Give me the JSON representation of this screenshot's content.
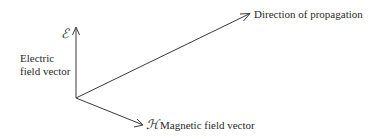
{
  "diagram": {
    "type": "electromagnetic-wave-vectors",
    "origin": [
      76,
      98
    ],
    "vectors": {
      "electric": {
        "symbol": "ℰ",
        "label_line1": "Electric",
        "label_line2": "field vector",
        "tip": [
          76,
          28
        ]
      },
      "magnetic": {
        "symbol": "ℋ",
        "label": "Magnetic field vector",
        "tip": [
          143,
          125
        ]
      },
      "propagation": {
        "label": "Direction of propagation",
        "tip": [
          250,
          14
        ]
      }
    },
    "colors": {
      "stroke": "#3a3a3a",
      "text": "#2a2a2a",
      "background": "#ffffff"
    }
  }
}
